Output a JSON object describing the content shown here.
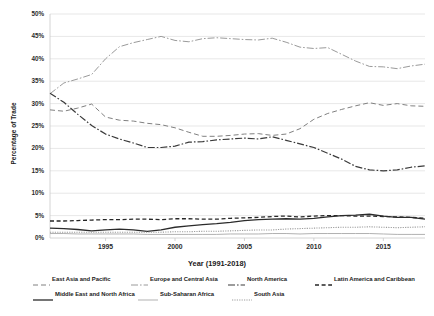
{
  "chart_data": {
    "type": "line",
    "title": "",
    "xlabel": "Year (1991-2018)",
    "ylabel": "Percentage of Trade",
    "xlim": [
      1991,
      2018
    ],
    "ylim": [
      0,
      50
    ],
    "grid": true,
    "grid_axis": "y",
    "legend_position": "bottom",
    "x": [
      1991,
      1992,
      1993,
      1994,
      1995,
      1996,
      1997,
      1998,
      1999,
      2000,
      2001,
      2002,
      2003,
      2004,
      2005,
      2006,
      2007,
      2008,
      2009,
      2010,
      2011,
      2012,
      2013,
      2014,
      2015,
      2016,
      2017,
      2018
    ],
    "xticks": [
      1995,
      2000,
      2005,
      2010,
      2015
    ],
    "xtick_labels": [
      "1995",
      "2000",
      "2005",
      "2010",
      "2015"
    ],
    "yticks": [
      0,
      5,
      10,
      15,
      20,
      25,
      30,
      35,
      40,
      45,
      50
    ],
    "ytick_labels": [
      "0%",
      "5%",
      "10%",
      "15%",
      "20%",
      "25%",
      "30%",
      "35%",
      "40%",
      "45%",
      "50%"
    ],
    "series": [
      {
        "name": "East Asia and Pacific",
        "dash": "5,3",
        "width": 1.0,
        "color": "#808080",
        "values": [
          28.6,
          28.3,
          29.0,
          29.9,
          27.0,
          26.3,
          26.1,
          25.6,
          25.3,
          24.6,
          23.6,
          22.7,
          22.7,
          22.9,
          23.2,
          23.3,
          22.9,
          23.2,
          24.4,
          26.5,
          27.8,
          28.7,
          29.5,
          30.2,
          29.6,
          30.0,
          29.5,
          29.4
        ]
      },
      {
        "name": "Europe and Central Asia",
        "dash": "7,2,1.6,2",
        "width": 1.0,
        "color": "#9a9a9a",
        "values": [
          32.2,
          34.6,
          35.5,
          36.5,
          40.0,
          42.7,
          43.6,
          44.3,
          45.0,
          44.1,
          43.8,
          44.5,
          44.7,
          44.5,
          44.3,
          44.2,
          44.6,
          43.7,
          42.6,
          42.3,
          42.5,
          41.0,
          39.5,
          38.3,
          38.2,
          37.8,
          38.4,
          38.8
        ]
      },
      {
        "name": "North America",
        "dash": "7,2,1.6,2",
        "width": 1.2,
        "color": "#3a3a3a",
        "values": [
          32.3,
          30.3,
          27.6,
          25.1,
          23.2,
          22.1,
          21.2,
          20.2,
          20.2,
          20.5,
          21.4,
          21.5,
          21.9,
          22.1,
          22.3,
          22.1,
          22.6,
          21.8,
          21.0,
          20.2,
          18.9,
          17.6,
          16.0,
          15.2,
          15.0,
          15.2,
          15.8,
          16.1
        ]
      },
      {
        "name": "Latin America and Caribbean",
        "dash": "4,2.6",
        "width": 1.3,
        "color": "#262626",
        "values": [
          3.8,
          3.8,
          3.9,
          4.0,
          4.1,
          4.1,
          4.2,
          4.2,
          4.1,
          4.3,
          4.3,
          4.2,
          4.2,
          4.4,
          4.5,
          4.6,
          4.8,
          4.9,
          4.7,
          4.9,
          5.0,
          5.0,
          4.9,
          4.9,
          4.8,
          4.7,
          4.6,
          4.4
        ]
      },
      {
        "name": "Middle East and North Africa",
        "dash": "none",
        "width": 1.3,
        "color": "#2b2b2b",
        "values": [
          2.2,
          2.1,
          1.9,
          1.6,
          1.8,
          2.0,
          1.8,
          1.5,
          1.8,
          2.4,
          2.7,
          3.0,
          3.2,
          3.5,
          3.9,
          4.1,
          4.2,
          4.3,
          4.2,
          4.4,
          4.7,
          5.0,
          5.1,
          5.3,
          4.9,
          4.6,
          4.6,
          4.2
        ]
      },
      {
        "name": "Sub-Saharan Africa",
        "dash": "none",
        "width": 0.9,
        "color": "#a8a8a8",
        "values": [
          1.0,
          1.0,
          0.9,
          0.9,
          0.9,
          0.9,
          0.9,
          0.8,
          0.8,
          0.8,
          0.8,
          0.8,
          0.8,
          0.9,
          0.9,
          0.9,
          1.0,
          1.0,
          0.9,
          1.0,
          1.0,
          1.0,
          1.0,
          1.0,
          0.9,
          0.8,
          0.8,
          0.8
        ]
      },
      {
        "name": "South Asia",
        "dash": "1.2,1.2",
        "width": 1.1,
        "color": "#9d9d9d",
        "values": [
          1.3,
          1.3,
          1.3,
          1.3,
          1.3,
          1.3,
          1.3,
          1.3,
          1.3,
          1.4,
          1.4,
          1.5,
          1.5,
          1.6,
          1.7,
          1.8,
          1.8,
          2.0,
          2.1,
          2.2,
          2.3,
          2.4,
          2.4,
          2.5,
          2.4,
          2.3,
          2.4,
          2.5
        ]
      }
    ]
  },
  "plot": {
    "left": 50,
    "top": 14,
    "width": 375,
    "height": 224,
    "axis_color": "#c9c9c9",
    "grid_color": "#d6d6d6",
    "background": "#ffffff"
  },
  "legend": {
    "rows": [
      [
        {
          "label": "East Asia and Pacific",
          "series": 0,
          "x": 33,
          "swatch_w": 17
        },
        {
          "label": "Europe and Central Asia",
          "series": 1,
          "x": 131,
          "swatch_w": 17
        },
        {
          "label": "North America",
          "series": 2,
          "x": 228,
          "swatch_w": 17
        },
        {
          "label": "Latin America and Caribbean",
          "series": 3,
          "x": 315,
          "swatch_w": 17
        }
      ],
      [
        {
          "label": "Middle East and North Africa",
          "series": 4,
          "x": 33,
          "swatch_w": 20
        },
        {
          "label": "Sub-Saharan Africa",
          "series": 5,
          "x": 138,
          "swatch_w": 20
        },
        {
          "label": "South Asia",
          "series": 6,
          "x": 232,
          "swatch_w": 20
        }
      ]
    ]
  }
}
